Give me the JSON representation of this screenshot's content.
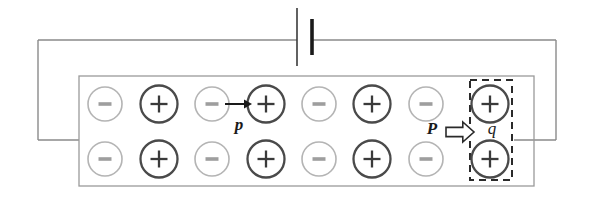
{
  "figure": {
    "type": "physics-circuit-diagram",
    "background_color": "#ffffff"
  },
  "colors": {
    "wire": "#8a8a8a",
    "slab_border": "#9a9a9a",
    "battery_plate_long": "#3a3a3a",
    "battery_plate_short": "#1a1a1a",
    "minus_circle": "#b4b4b4",
    "minus_sign": "#9e9e9e",
    "plus_circle": "#4a4a4a",
    "plus_sign": "#3a3a3a",
    "dashed_box": "#2a2a2a",
    "arrow_small": "#1a1a1a",
    "arrow_block": "#2a2a2a",
    "label_text": "#1a1a1a"
  },
  "battery": {
    "name": "battery",
    "long_plate": {
      "x": 297,
      "y1": 8,
      "y2": 66,
      "width": 1.6
    },
    "short_plate": {
      "x": 312,
      "y1": 19,
      "y2": 55,
      "width": 3.6
    }
  },
  "wires": {
    "top_left": {
      "x1": 38,
      "y1": 40,
      "x2": 297,
      "y2": 40
    },
    "top_right": {
      "x1": 312,
      "y1": 40,
      "x2": 556,
      "y2": 40
    },
    "left_vertical": {
      "x": 38,
      "y1": 40,
      "y2": 140
    },
    "right_vertical": {
      "x": 556,
      "y1": 40,
      "y2": 140
    },
    "left_stub": {
      "x1": 38,
      "y1": 140,
      "x2": 79,
      "y2": 140
    },
    "right_stub": {
      "x1": 514,
      "y1": 140,
      "x2": 556,
      "y2": 140
    }
  },
  "slab": {
    "name": "charge-slab",
    "x": 79,
    "y": 76,
    "width": 455,
    "height": 110
  },
  "lattice": {
    "rows": [
      {
        "name": "top-row",
        "cy": 104,
        "charges": [
          {
            "sign": "-",
            "cx": 105
          },
          {
            "sign": "+",
            "cx": 159
          },
          {
            "sign": "-",
            "cx": 212
          },
          {
            "sign": "+",
            "cx": 266
          },
          {
            "sign": "-",
            "cx": 319
          },
          {
            "sign": "+",
            "cx": 372
          },
          {
            "sign": "-",
            "cx": 426
          },
          {
            "sign": "+",
            "cx": 490
          }
        ]
      },
      {
        "name": "bottom-row",
        "cy": 159,
        "charges": [
          {
            "sign": "-",
            "cx": 105
          },
          {
            "sign": "+",
            "cx": 159
          },
          {
            "sign": "-",
            "cx": 212
          },
          {
            "sign": "+",
            "cx": 266
          },
          {
            "sign": "-",
            "cx": 319
          },
          {
            "sign": "+",
            "cx": 372
          },
          {
            "sign": "-",
            "cx": 426
          },
          {
            "sign": "+",
            "cx": 490
          }
        ]
      }
    ],
    "minus_radius": 17,
    "plus_radius": 18.5,
    "minus_symbol": "−",
    "plus_symbol": "+"
  },
  "annotations": {
    "small_arrow": {
      "name": "momentum-arrow-p",
      "x1": 225,
      "y1": 104,
      "x2": 252,
      "y2": 104
    },
    "label_p": {
      "text": "p",
      "x": 239,
      "y": 130
    },
    "label_P": {
      "text": "P",
      "x": 432,
      "y": 134
    },
    "block_arrow": {
      "name": "polarization-block-arrow",
      "x": 446,
      "y": 122,
      "width": 28,
      "height": 20
    },
    "label_q": {
      "text": "q",
      "x": 492,
      "y": 134
    },
    "dashed_box": {
      "name": "charge-q-selection",
      "x": 470,
      "y": 80,
      "width": 42,
      "height": 100
    }
  }
}
